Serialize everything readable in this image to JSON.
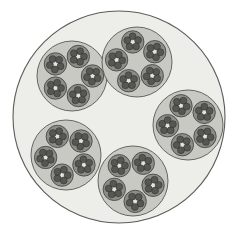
{
  "figure": {
    "name": "recursive-circle-packing",
    "title": "Recursive circle packing (Apollonian-style fractal)",
    "canvas": {
      "width": 240,
      "height": 234,
      "background": "#ffffff"
    },
    "depth_levels": 4,
    "branching_factor": 5
  },
  "palette": {
    "background": "#ffffff",
    "level0_fill": "#ededea",
    "level0_stroke": "#5c5c58",
    "level1_fill": "#c9c9c4",
    "level1_stroke": "#585854",
    "level2_fill": "#8d8d88",
    "level2_stroke": "#3c3c39",
    "level3_fill": "#565653",
    "level3_stroke": "#2b2b29",
    "core_fill": "#e4e4e0"
  },
  "geometry": {
    "level0": {
      "label": "outer-circle",
      "cx": 119,
      "cy": 117,
      "r": 106,
      "stroke_width": 1.1
    },
    "level1": {
      "label": "medium-circle",
      "count": 5,
      "r": 35,
      "stroke_width": 0.9,
      "centers": [
        {
          "id": "top-left",
          "cx": 72,
          "cy": 76,
          "rotation": 18
        },
        {
          "id": "top-right",
          "cx": 137,
          "cy": 62,
          "rotation": -12
        },
        {
          "id": "right",
          "cx": 188,
          "cy": 125,
          "rotation": 52
        },
        {
          "id": "bottom",
          "cx": 133,
          "cy": 181,
          "rotation": 30
        },
        {
          "id": "bottom-left",
          "cx": 66,
          "cy": 155,
          "rotation": -25
        }
      ]
    },
    "level2": {
      "label": "small-circle",
      "count_per_parent": 5,
      "r": 11.2,
      "ring_radius": 20.5,
      "stroke_width": 0.8
    },
    "level3": {
      "label": "tiny-dot",
      "count_per_parent": 5,
      "r": 3.5,
      "ring_radius": 5.6,
      "stroke_width": 0.5
    }
  },
  "chart_data": {
    "type": "scatter",
    "title": "Recursive circle packing (Apollonian-style fractal)",
    "xlabel": "",
    "ylabel": "",
    "xlim": [
      0,
      240
    ],
    "ylim": [
      0,
      234
    ],
    "grid": false,
    "legend": "none",
    "annotations": [],
    "series": [
      {
        "name": "level-0 outer circle",
        "radius": 106,
        "values": [
          {
            "x": 119,
            "y": 117
          }
        ]
      },
      {
        "name": "level-1 medium circles",
        "radius": 35,
        "values": [
          {
            "x": 72,
            "y": 76
          },
          {
            "x": 137,
            "y": 62
          },
          {
            "x": 188,
            "y": 125
          },
          {
            "x": 133,
            "y": 181
          },
          {
            "x": 66,
            "y": 155
          }
        ]
      },
      {
        "name": "level-2 small circles",
        "radius": 11.2,
        "count": 25,
        "note": "5 per level-1 circle, arranged on a ring of radius 20.5"
      },
      {
        "name": "level-3 tiny dots",
        "radius": 3.5,
        "count": 125,
        "note": "5 per level-2 circle, arranged on a ring of radius 5.6"
      }
    ]
  }
}
